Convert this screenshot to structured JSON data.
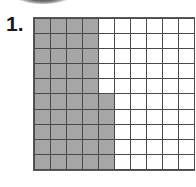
{
  "problem": {
    "number_label": "1.",
    "grid": {
      "rows": 10,
      "columns": 10,
      "total_cells": 100,
      "shaded_cells": 45,
      "shaded_description": "Columns 1-4 fully shaded (40 cells); column 5 shaded in rows 6-10 (5 cells)",
      "shaded_by_column": [
        10,
        10,
        10,
        10,
        5,
        0,
        0,
        0,
        0,
        0
      ],
      "shade_start_row_by_column": [
        1,
        1,
        1,
        1,
        6,
        0,
        0,
        0,
        0,
        0
      ]
    },
    "colors": {
      "shaded": "#a6a6a6",
      "unshaded": "#ffffff",
      "gridline": "#4a4a4a"
    }
  }
}
